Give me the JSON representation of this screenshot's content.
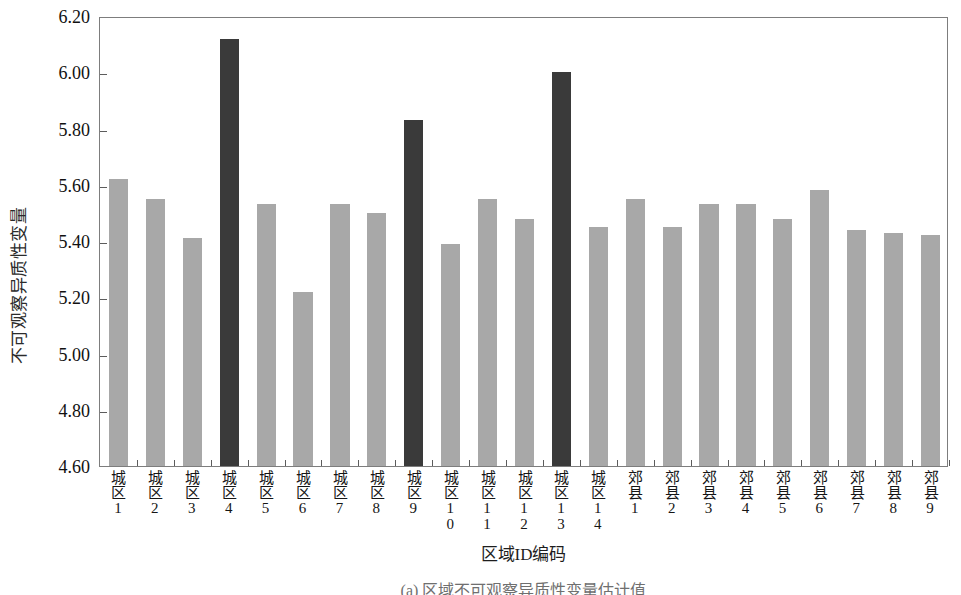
{
  "chart_data": {
    "type": "bar",
    "title": "",
    "xlabel": "区域ID编码",
    "ylabel": "不可观察异质性变量",
    "ylim": [
      4.6,
      6.2
    ],
    "ytick_step": 0.2,
    "yticks": [
      "6.20",
      "6.00",
      "5.80",
      "5.60",
      "5.40",
      "5.20",
      "5.00",
      "4.80",
      "4.60"
    ],
    "ytick_values": [
      6.2,
      6.0,
      5.8,
      5.6,
      5.4,
      5.2,
      5.0,
      4.8,
      4.6
    ],
    "grid": false,
    "legend": "none",
    "categories": [
      "城区1",
      "城区2",
      "城区3",
      "城区4",
      "城区5",
      "城区6",
      "城区7",
      "城区8",
      "城区9",
      "城区10",
      "城区11",
      "城区12",
      "城区13",
      "城区14",
      "郊县1",
      "郊县2",
      "郊县3",
      "郊县4",
      "郊县5",
      "郊县6",
      "郊县7",
      "郊县8",
      "郊县9"
    ],
    "values": [
      5.62,
      5.55,
      5.41,
      6.12,
      5.53,
      5.22,
      5.53,
      5.5,
      5.83,
      5.39,
      5.55,
      5.48,
      6.0,
      5.45,
      5.55,
      5.45,
      5.53,
      5.53,
      5.48,
      5.58,
      5.44,
      5.43,
      5.42
    ],
    "highlight_indices": [
      3,
      8,
      12
    ],
    "bar_color": "#a8a8a8",
    "bar_highlight_color": "#3a3a3a",
    "axis_color": "#7d7d7d"
  },
  "caption": {
    "text": "(a) 区域不可观察异质性变量估计值"
  }
}
